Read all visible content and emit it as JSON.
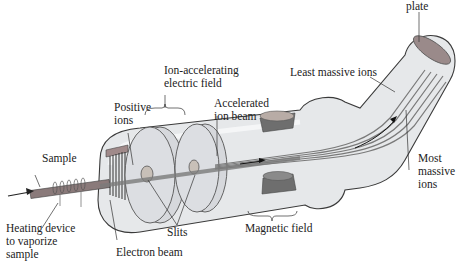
{
  "diagram": {
    "labels": {
      "plate": "plate",
      "least_massive_ions": "Least massive ions",
      "ion_accelerating_1": "Ion-accelerating",
      "ion_accelerating_2": "electric field",
      "positive_ions_1": "Positive",
      "positive_ions_2": "ions",
      "accelerated_1": "Accelerated",
      "accelerated_2": "ion beam",
      "sample": "Sample",
      "heating_1": "Heating device",
      "heating_2": "to vaporize",
      "heating_3": "sample",
      "electron_beam": "Electron beam",
      "slits": "Slits",
      "magnetic_field": "Magnetic field",
      "most_massive_1": "Most",
      "most_massive_2": "massive",
      "most_massive_3": "ions"
    },
    "colors": {
      "tube_fill": "#e4e6e8",
      "tube_outline": "#3a3a3a",
      "beam": "#7a7a7a",
      "magnet": "#6e6e6e",
      "magnet_top": "#b8a8a0",
      "plate": "#8a6a6a",
      "disc": "#d0d2d6"
    }
  }
}
